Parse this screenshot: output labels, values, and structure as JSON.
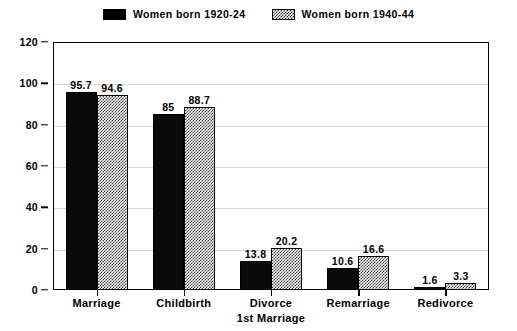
{
  "chart_data": {
    "type": "bar",
    "title": "",
    "subtitle": "",
    "xlabel": "",
    "ylabel": "",
    "ylim": [
      0,
      120
    ],
    "ytick_values": [
      0,
      20,
      40,
      60,
      80,
      100,
      120
    ],
    "ytick_labels": [
      "0",
      "20",
      "40",
      "60",
      "80",
      "100",
      "120"
    ],
    "grid": true,
    "grid_axis": "y",
    "legend_position": "top-center",
    "categories": [
      "Marriage",
      "Childbirth",
      "Divorce 1st Marriage",
      "Remarriage",
      "Redivorce"
    ],
    "category_lines": [
      [
        "Marriage"
      ],
      [
        "Childbirth"
      ],
      [
        "Divorce",
        "1st Marriage"
      ],
      [
        "Remarriage"
      ],
      [
        "Redivorce"
      ]
    ],
    "series": [
      {
        "name": "Women born 1920-24",
        "fill": "solid-black",
        "color": "#000000",
        "values": [
          95.7,
          85,
          13.8,
          10.6,
          1.6
        ],
        "value_labels": [
          "95.7",
          "85",
          "13.8",
          "10.6",
          "1.6"
        ]
      },
      {
        "name": "Women born 1940-44",
        "fill": "crosshatch",
        "color": "#3a3a3a",
        "values": [
          94.6,
          88.7,
          20.2,
          16.6,
          3.3
        ],
        "value_labels": [
          "94.6",
          "88.7",
          "20.2",
          "16.6",
          "3.3"
        ]
      }
    ]
  },
  "legend": {
    "entries": [
      {
        "label": "Women born 1920-24",
        "swatch": "solid-swatch"
      },
      {
        "label": "Women born 1940-44",
        "swatch": "hatched-swatch"
      }
    ]
  },
  "colors": {
    "background": "#ffffff",
    "axis": "#000000",
    "gridline": "#d8d8d8",
    "series_1": "#000000",
    "series_2": "#3a3a3a"
  }
}
